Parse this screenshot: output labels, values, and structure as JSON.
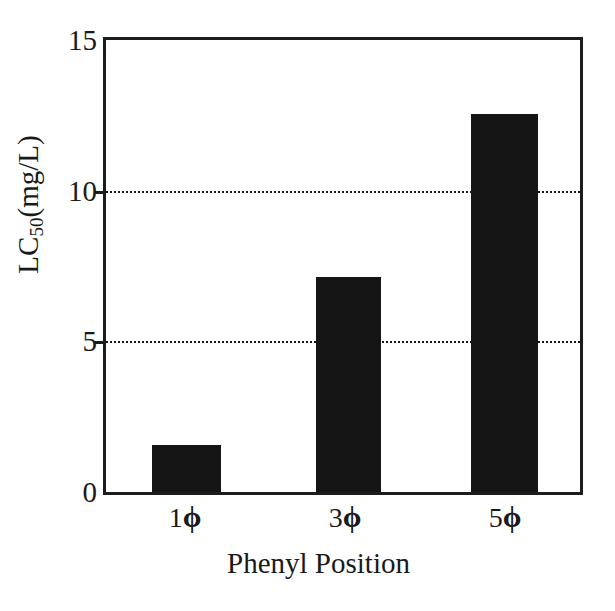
{
  "chart_data": {
    "type": "bar",
    "title": "",
    "subtitle": "",
    "xlabel": "Phenyl Position",
    "ylabel": "LC50(mg/L)",
    "ylabel_base": "LC",
    "ylabel_sub": "50",
    "ylabel_suffix": "(mg/L)",
    "categories": [
      "1ϕ",
      "3ϕ",
      "5ϕ"
    ],
    "category_numbers": [
      "1",
      "3",
      "5"
    ],
    "category_symbol": "ϕ",
    "values": [
      1.55,
      7.15,
      12.55
    ],
    "ylim": [
      0,
      15
    ],
    "xlim_note": "categorical",
    "yticks": [
      0,
      5,
      10,
      15
    ],
    "ytick_labels": [
      "0",
      "5",
      "10",
      "15"
    ],
    "gridlines_at": [
      5,
      10
    ],
    "grid": "horizontal dotted at 5 and 10 only",
    "legend": "none",
    "legend_position": "none",
    "bar_color": "#151515",
    "axis_color": "#1c1c1c",
    "background_color": "#ffffff",
    "bars": [
      {
        "category": "1ϕ",
        "value": 1.55,
        "left_pct": 9.8,
        "width_pct": 14.4
      },
      {
        "category": "3ϕ",
        "value": 7.15,
        "left_pct": 44.2,
        "width_pct": 13.8
      },
      {
        "category": "5ϕ",
        "value": 12.55,
        "left_pct": 77.1,
        "width_pct": 14.0
      }
    ],
    "category_centers_px": [
      185,
      345,
      505
    ]
  }
}
